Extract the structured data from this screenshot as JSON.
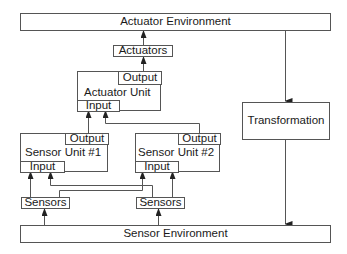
{
  "diagram": {
    "actuator_environment": {
      "label": "Actuator Environment"
    },
    "actuators": {
      "label": "Actuators"
    },
    "actuator_unit": {
      "label": "Actuator Unit",
      "output_label": "Output",
      "input_label": "Input"
    },
    "transformation": {
      "label": "Transformation"
    },
    "sensor_unit_1": {
      "label": "Sensor Unit #1",
      "output_label": "Output",
      "input_label": "Input"
    },
    "sensor_unit_2": {
      "label": "Sensor Unit #2",
      "output_label": "Output",
      "input_label": "Input"
    },
    "sensors_1": {
      "label": "Sensors"
    },
    "sensors_2": {
      "label": "Sensors"
    },
    "sensor_environment": {
      "label": "Sensor Environment"
    }
  },
  "colors": {
    "line": "#555555",
    "text": "#1a1a1a",
    "background": "#ffffff"
  }
}
